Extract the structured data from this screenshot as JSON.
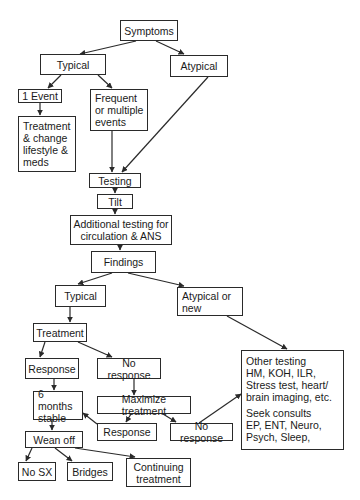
{
  "diagram": {
    "type": "flowchart",
    "colors": {
      "line": "#2a2a2a",
      "text": "#1a1a1a",
      "background": "#ffffff"
    },
    "nodes": {
      "symptoms": "Symptoms",
      "typical_top": "Typical",
      "atypical_top": "Atypical",
      "one_event": "1 Event",
      "frequent": "Frequent\nor multiple\nevents",
      "treatment_change": "Treatment\n& change\nlifestyle &\nmeds",
      "testing": "Testing",
      "tilt": "Tilt",
      "additional_testing": "Additional testing for\ncirculation & ANS",
      "findings": "Findings",
      "typical_mid": "Typical",
      "atypical_new": "Atypical or\nnew",
      "treatment": "Treatment",
      "response_1": "Response",
      "no_response_1": "No response",
      "six_months": "6 months\nstable",
      "maximize": "Maximize treatment",
      "response_2": "Response",
      "no_response_2": "No response",
      "wean_off": "Wean off",
      "no_sx": "No SX",
      "bridges": "Bridges",
      "continuing": "Continuing\ntreatment",
      "other_testing_1": "Other testing\nHM, KOH, ILR,\nStress test, heart/\nbrain imaging, etc.",
      "other_testing_2": "Seek consults\nEP, ENT, Neuro,\nPsych, Sleep,"
    },
    "edges": [
      [
        "Symptoms",
        "Typical"
      ],
      [
        "Symptoms",
        "Atypical"
      ],
      [
        "Typical",
        "1 Event"
      ],
      [
        "Typical",
        "Frequent or multiple events"
      ],
      [
        "1 Event",
        "Treatment & change lifestyle & meds"
      ],
      [
        "Frequent or multiple events",
        "Testing"
      ],
      [
        "Atypical",
        "Testing"
      ],
      [
        "Testing",
        "Tilt"
      ],
      [
        "Tilt",
        "Additional testing for circulation & ANS"
      ],
      [
        "Additional testing for circulation & ANS",
        "Findings"
      ],
      [
        "Findings",
        "Typical"
      ],
      [
        "Findings",
        "Atypical or new"
      ],
      [
        "Typical",
        "Treatment"
      ],
      [
        "Treatment",
        "Response"
      ],
      [
        "Treatment",
        "No response"
      ],
      [
        "Response",
        "6 months stable"
      ],
      [
        "No response",
        "Maximize treatment"
      ],
      [
        "Maximize treatment",
        "Response"
      ],
      [
        "Maximize treatment",
        "No response"
      ],
      [
        "Response",
        "6 months stable"
      ],
      [
        "No response",
        "Other testing"
      ],
      [
        "Atypical or new",
        "Other testing"
      ],
      [
        "6 months stable",
        "Wean off"
      ],
      [
        "Wean off",
        "No SX"
      ],
      [
        "Wean off",
        "Bridges"
      ],
      [
        "Wean off",
        "Continuing treatment"
      ]
    ]
  }
}
